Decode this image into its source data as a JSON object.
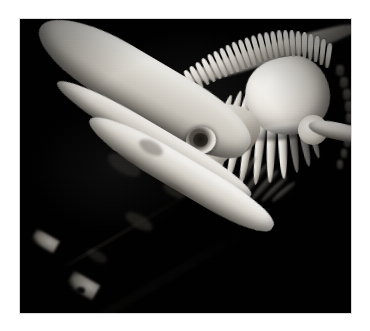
{
  "image": {
    "subject": "baleen whale skeleton",
    "scene_description": "Museum-mounted whale skeleton photographed against a black background, the long rostrum and paired mandibles angling toward the lower left.",
    "orientation": "landscape",
    "background_color": "#000000",
    "border_color": "#ffffff",
    "mat_color": "#d8d8d8",
    "bone_highlight_color": "#faf9f6",
    "bone_midtone_color": "#c8c4bb",
    "bone_shadow_color": "#4a463f",
    "palette": "monochrome black and white",
    "frame": {
      "left": 20,
      "top": 19,
      "width": 331,
      "height": 294
    }
  },
  "anatomy": {
    "parts": [
      {
        "id": "upper-jaw",
        "label": "Upper jaw / maxilla (rostrum)"
      },
      {
        "id": "cranium",
        "label": "Cranium / braincase"
      },
      {
        "id": "orbit",
        "label": "Eye socket (orbit)"
      },
      {
        "id": "occipital",
        "label": "Occipital crest"
      },
      {
        "id": "mandible-upper",
        "label": "Left mandible"
      },
      {
        "id": "mandible-lower",
        "label": "Right mandible"
      },
      {
        "id": "spine",
        "label": "Vertebral column with neural spines"
      },
      {
        "id": "scapula",
        "label": "Scapula (shoulder blade)"
      },
      {
        "id": "ribs",
        "label": "Rib cage"
      },
      {
        "id": "humerus",
        "label": "Flipper bone (humerus)"
      }
    ]
  },
  "geometry": {
    "neural_spines": [
      {
        "x": 168,
        "y": 50,
        "w": 5,
        "h": 22,
        "rot": -30
      },
      {
        "x": 174,
        "y": 46,
        "w": 5,
        "h": 24,
        "rot": -29
      },
      {
        "x": 180,
        "y": 42,
        "w": 5,
        "h": 25,
        "rot": -28
      },
      {
        "x": 186,
        "y": 38,
        "w": 5,
        "h": 26,
        "rot": -27
      },
      {
        "x": 192,
        "y": 34,
        "w": 5,
        "h": 27,
        "rot": -26
      },
      {
        "x": 198,
        "y": 31,
        "w": 5,
        "h": 28,
        "rot": -25
      },
      {
        "x": 204,
        "y": 28,
        "w": 5,
        "h": 28,
        "rot": -24
      },
      {
        "x": 210,
        "y": 25,
        "w": 5,
        "h": 29,
        "rot": -23
      },
      {
        "x": 216,
        "y": 22,
        "w": 5,
        "h": 29,
        "rot": -22
      },
      {
        "x": 222,
        "y": 20,
        "w": 5,
        "h": 29,
        "rot": -20
      },
      {
        "x": 228,
        "y": 18,
        "w": 5,
        "h": 29,
        "rot": -18
      },
      {
        "x": 234,
        "y": 16,
        "w": 5,
        "h": 28,
        "rot": -16
      },
      {
        "x": 240,
        "y": 14,
        "w": 5,
        "h": 28,
        "rot": -14
      },
      {
        "x": 246,
        "y": 13,
        "w": 5,
        "h": 27,
        "rot": -12
      },
      {
        "x": 252,
        "y": 12,
        "w": 5,
        "h": 27,
        "rot": -10
      },
      {
        "x": 258,
        "y": 11,
        "w": 5,
        "h": 26,
        "rot": -8
      },
      {
        "x": 264,
        "y": 11,
        "w": 5,
        "h": 26,
        "rot": -6
      },
      {
        "x": 270,
        "y": 11,
        "w": 5,
        "h": 26,
        "rot": -4
      },
      {
        "x": 276,
        "y": 12,
        "w": 5,
        "h": 26,
        "rot": -2
      },
      {
        "x": 282,
        "y": 13,
        "w": 5,
        "h": 26,
        "rot": 0
      },
      {
        "x": 288,
        "y": 15,
        "w": 5,
        "h": 26,
        "rot": 2
      },
      {
        "x": 294,
        "y": 17,
        "w": 5,
        "h": 26,
        "rot": 4
      },
      {
        "x": 300,
        "y": 20,
        "w": 5,
        "h": 26,
        "rot": 6
      },
      {
        "x": 306,
        "y": 24,
        "w": 5,
        "h": 25,
        "rot": 8
      }
    ],
    "ribs": [
      {
        "x": 194,
        "y": 74,
        "w": 9,
        "h": 82,
        "rot": 18,
        "radius": "50%",
        "dim": false
      },
      {
        "x": 204,
        "y": 70,
        "w": 9,
        "h": 90,
        "rot": 16,
        "radius": "50%",
        "dim": false
      },
      {
        "x": 214,
        "y": 68,
        "w": 9,
        "h": 96,
        "rot": 13,
        "radius": "50%",
        "dim": false
      },
      {
        "x": 225,
        "y": 68,
        "w": 9,
        "h": 98,
        "rot": 10,
        "radius": "50%",
        "dim": false
      },
      {
        "x": 236,
        "y": 70,
        "w": 9,
        "h": 96,
        "rot": 6,
        "radius": "50%",
        "dim": false
      },
      {
        "x": 247,
        "y": 72,
        "w": 9,
        "h": 92,
        "rot": 2,
        "radius": "50%",
        "dim": false
      },
      {
        "x": 258,
        "y": 74,
        "w": 9,
        "h": 86,
        "rot": -2,
        "radius": "50%",
        "dim": false
      },
      {
        "x": 269,
        "y": 76,
        "w": 8,
        "h": 78,
        "rot": -6,
        "radius": "50%",
        "dim": true
      },
      {
        "x": 279,
        "y": 78,
        "w": 8,
        "h": 70,
        "rot": -10,
        "radius": "50%",
        "dim": true
      },
      {
        "x": 288,
        "y": 80,
        "w": 7,
        "h": 60,
        "rot": -14,
        "radius": "50%",
        "dim": true
      }
    ],
    "far_vertebrae": [
      {
        "x": 316,
        "y": 46,
        "w": 8,
        "h": 11
      },
      {
        "x": 320,
        "y": 58,
        "w": 8,
        "h": 11
      },
      {
        "x": 323,
        "y": 70,
        "w": 8,
        "h": 11
      },
      {
        "x": 325,
        "y": 82,
        "w": 8,
        "h": 11
      },
      {
        "x": 326,
        "y": 94,
        "w": 7,
        "h": 10
      },
      {
        "x": 326,
        "y": 106,
        "w": 7,
        "h": 10
      },
      {
        "x": 324,
        "y": 118,
        "w": 7,
        "h": 10
      },
      {
        "x": 321,
        "y": 130,
        "w": 6,
        "h": 9
      },
      {
        "x": 317,
        "y": 141,
        "w": 6,
        "h": 9
      }
    ],
    "shadow_ribs": [
      {
        "x": 222,
        "y": 134,
        "w": 6,
        "h": 40,
        "rot": 34
      },
      {
        "x": 232,
        "y": 140,
        "w": 6,
        "h": 42,
        "rot": 38
      },
      {
        "x": 242,
        "y": 146,
        "w": 6,
        "h": 40,
        "rot": 42
      },
      {
        "x": 252,
        "y": 152,
        "w": 5,
        "h": 36,
        "rot": 46
      },
      {
        "x": 261,
        "y": 158,
        "w": 5,
        "h": 30,
        "rot": 50
      }
    ]
  }
}
